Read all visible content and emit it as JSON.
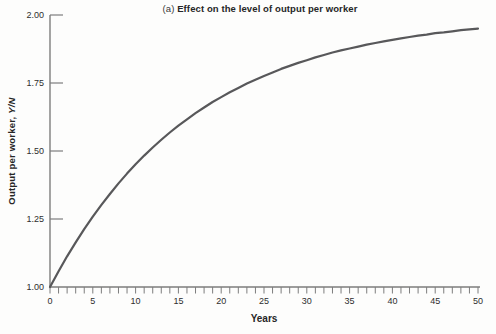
{
  "figure": {
    "title": {
      "prefix": "(a)",
      "text": "Effect on the level of output per worker"
    },
    "ylabel_main": "Output per worker, ",
    "ylabel_var": "Y/N",
    "xlabel": "Years"
  },
  "chart_data": {
    "type": "line",
    "title": "(a) Effect on the level of output per worker",
    "xlabel": "Years",
    "ylabel": "Output per worker, Y/N",
    "xlim": [
      0,
      50
    ],
    "ylim": [
      1.0,
      2.0
    ],
    "x_tick_labels": [
      0,
      5,
      10,
      15,
      20,
      25,
      30,
      35,
      40,
      45,
      50
    ],
    "x_minor_tick_step": 1,
    "y_ticks": [
      1.0,
      1.25,
      1.5,
      1.75,
      2.0
    ],
    "grid": false,
    "legend": "none",
    "series": [
      {
        "name": "Output per worker (Y/N)",
        "x": [
          0,
          1,
          2,
          3,
          4,
          5,
          6,
          7,
          8,
          9,
          10,
          11,
          12,
          13,
          14,
          15,
          16,
          17,
          18,
          19,
          20,
          21,
          22,
          23,
          24,
          25,
          26,
          27,
          28,
          29,
          30,
          31,
          32,
          33,
          34,
          35,
          36,
          37,
          38,
          39,
          40,
          41,
          42,
          43,
          44,
          45,
          46,
          47,
          48,
          49,
          50
        ],
        "y": [
          1.0,
          1.058,
          1.113,
          1.164,
          1.213,
          1.259,
          1.302,
          1.342,
          1.381,
          1.417,
          1.451,
          1.483,
          1.513,
          1.541,
          1.568,
          1.593,
          1.616,
          1.639,
          1.66,
          1.68,
          1.698,
          1.716,
          1.732,
          1.748,
          1.762,
          1.776,
          1.789,
          1.802,
          1.813,
          1.824,
          1.834,
          1.844,
          1.853,
          1.862,
          1.87,
          1.877,
          1.884,
          1.891,
          1.897,
          1.903,
          1.909,
          1.914,
          1.919,
          1.924,
          1.928,
          1.933,
          1.936,
          1.94,
          1.944,
          1.947,
          1.95
        ]
      }
    ],
    "colors": {
      "curve": "#58585a",
      "axis": "#7d7d7d",
      "tick": "#7d7d7d",
      "text": "#2d2d2d"
    }
  }
}
